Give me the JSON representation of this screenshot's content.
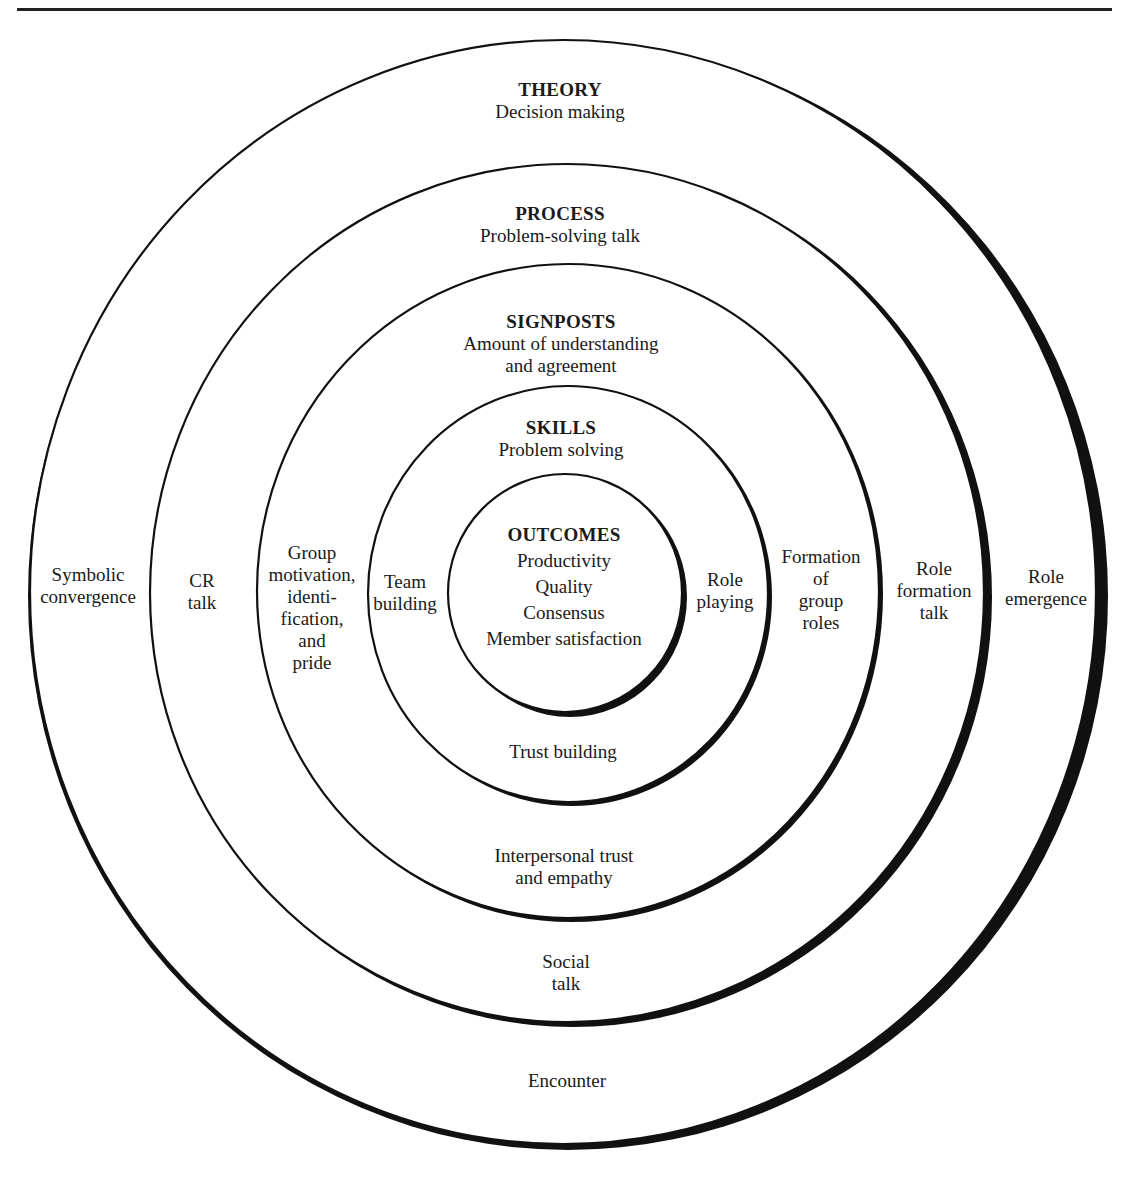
{
  "diagram": {
    "circles": [
      {
        "name": "theory",
        "heading": "THEORY",
        "lines": [
          "Decision making"
        ],
        "left": "Symbolic convergence",
        "right": "Role emergence",
        "bottom": "Encounter"
      },
      {
        "name": "process",
        "heading": "PROCESS",
        "lines": [
          "Problem-solving talk"
        ],
        "left": "CR talk",
        "right": "Role formation talk",
        "bottom": "Social talk"
      },
      {
        "name": "signposts",
        "heading": "SIGNPOSTS",
        "lines": [
          "Amount of understanding",
          "and agreement"
        ],
        "left": "Group motivation, identification, and pride",
        "right": "Formation of group roles",
        "bottom": "Interpersonal trust and empathy"
      },
      {
        "name": "skills",
        "heading": "SKILLS",
        "lines": [
          "Problem solving"
        ],
        "left": "Team building",
        "right": "Role playing",
        "bottom": "Trust building"
      },
      {
        "name": "outcomes",
        "heading": "OUTCOMES",
        "lines": [
          "Productivity",
          "Quality",
          "Consensus",
          "Member satisfaction"
        ]
      }
    ]
  },
  "labels": {
    "theory_h": "THEORY",
    "theory_1": "Decision making",
    "process_h": "PROCESS",
    "process_1": "Problem-solving talk",
    "signposts_h": "SIGNPOSTS",
    "signposts_1": "Amount of understanding",
    "signposts_2": "and agreement",
    "skills_h": "SKILLS",
    "skills_1": "Problem solving",
    "outcomes_h": "OUTCOMES",
    "outcomes_1": "Productivity",
    "outcomes_2": "Quality",
    "outcomes_3": "Consensus",
    "outcomes_4": "Member satisfaction",
    "left_1a": "Symbolic",
    "left_1b": "convergence",
    "left_2a": "CR",
    "left_2b": "talk",
    "left_3a": "Group",
    "left_3b": "motivation,",
    "left_3c": "identi-",
    "left_3d": "fication,",
    "left_3e": "and",
    "left_3f": "pride",
    "left_4a": "Team",
    "left_4b": "building",
    "right_4a": "Role",
    "right_4b": "playing",
    "right_3a": "Formation",
    "right_3b": "of",
    "right_3c": "group",
    "right_3d": "roles",
    "right_2a": "Role",
    "right_2b": "formation",
    "right_2c": "talk",
    "right_1a": "Role",
    "right_1b": "emergence",
    "bottom_4": "Trust building",
    "bottom_3a": "Interpersonal trust",
    "bottom_3b": "and empathy",
    "bottom_2a": "Social",
    "bottom_2b": "talk",
    "bottom_1": "Encounter"
  },
  "colors": {
    "ink": "#1a1a1a",
    "paper": "#ffffff"
  }
}
